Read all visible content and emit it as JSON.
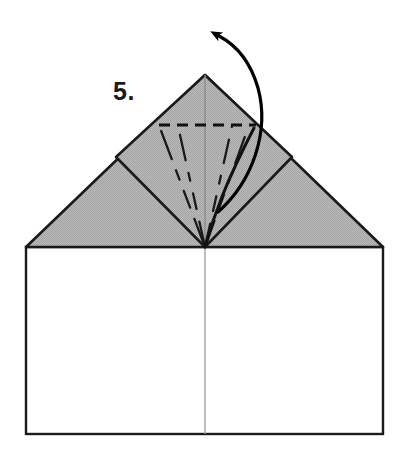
{
  "figure": {
    "kind": "origami-folding-diagram",
    "step_number_label": "5.",
    "caption_text": "",
    "canvas": {
      "width": 409,
      "height": 465
    },
    "colors": {
      "paper_front": "#ffffff",
      "paper_back_shaded": "#b3b3b3",
      "outline": "#1a1a1a",
      "crease_light": "#8a8a8a",
      "arrow": "#000000",
      "background": "#ffffff"
    },
    "geometry": {
      "sheet_left_x": 26,
      "sheet_right_x": 383,
      "sheet_bottom_y": 434,
      "horizontal_fold_y": 247,
      "center_x": 205,
      "apex": {
        "x": 205,
        "y": 75
      },
      "triangle_left": {
        "x": 26,
        "y": 247
      },
      "triangle_right": {
        "x": 383,
        "y": 247
      },
      "diamond_left": {
        "x": 116,
        "y": 157
      },
      "diamond_right": {
        "x": 292,
        "y": 157
      },
      "diamond_bottom": {
        "x": 205,
        "y": 247
      },
      "valley_dashed_line": {
        "x1": 159,
        "y1": 125,
        "x2": 256,
        "y2": 125
      },
      "arrow_tip": {
        "x": 216,
        "y": 34
      },
      "arrow_tail": {
        "x": 218,
        "y": 212
      }
    },
    "elements": {
      "lower_rectangle_name": "lower paper panel",
      "shaded_triangle_name": "shaded folded flap",
      "inner_diamond_name": "inner square flap",
      "dashed_fold_name": "valley fold line",
      "arrow_name": "fold direction arrow",
      "center_crease_name": "vertical center crease"
    }
  }
}
